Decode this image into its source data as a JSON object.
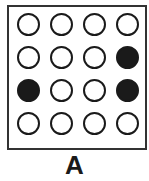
{
  "figure": {
    "label": "A",
    "grid": {
      "rows": 4,
      "cols": 4,
      "cells": [
        [
          0,
          0,
          0,
          0
        ],
        [
          0,
          0,
          0,
          1
        ],
        [
          1,
          0,
          0,
          1
        ],
        [
          0,
          0,
          0,
          0
        ]
      ],
      "legend": {
        "0": "empty circle",
        "1": "filled circle"
      }
    },
    "colors": {
      "stroke": "#1a1a1a",
      "fill": "#1a1a1a",
      "background": "#ffffff"
    }
  }
}
